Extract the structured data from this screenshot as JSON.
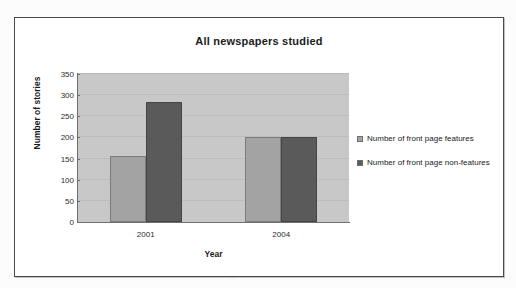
{
  "chart_data": {
    "type": "bar",
    "title": "All newspapers studied",
    "xlabel": "Year",
    "ylabel": "Number of stories",
    "categories": [
      "2001",
      "2004"
    ],
    "series": [
      {
        "name": "Number of front page features",
        "values": [
          155,
          200
        ],
        "color": "#a3a3a3"
      },
      {
        "name": "Number of front page non-features",
        "values": [
          285,
          200
        ],
        "color": "#5a5a5a"
      }
    ],
    "ylim": [
      0,
      350
    ],
    "yticks": [
      0,
      50,
      100,
      150,
      200,
      250,
      300,
      350
    ],
    "ytick_labels": [
      "0",
      "50",
      "100",
      "150",
      "200",
      "250",
      "300",
      "350"
    ],
    "grid": true,
    "legend_position": "right",
    "plot_background": "#c8c8c8",
    "frame_color": "#4a4a4a"
  }
}
